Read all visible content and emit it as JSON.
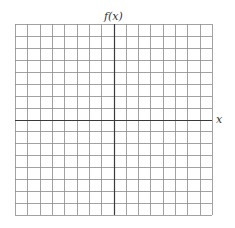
{
  "graph": {
    "y_axis_label": "f(x)",
    "x_axis_label": "x",
    "columns": 16,
    "rows": 16,
    "grid_color": "#8a8a8a",
    "axis_color": "#3a3a3a",
    "origin_column": 8,
    "origin_row": 8
  },
  "chart_data": {
    "type": "scatter",
    "title": "",
    "xlabel": "x",
    "ylabel": "f(x)",
    "x": [],
    "y": [],
    "grid": true,
    "grid_cells": [
      16,
      16
    ],
    "xlim": [
      -8,
      8
    ],
    "ylim": [
      -8,
      8
    ]
  }
}
